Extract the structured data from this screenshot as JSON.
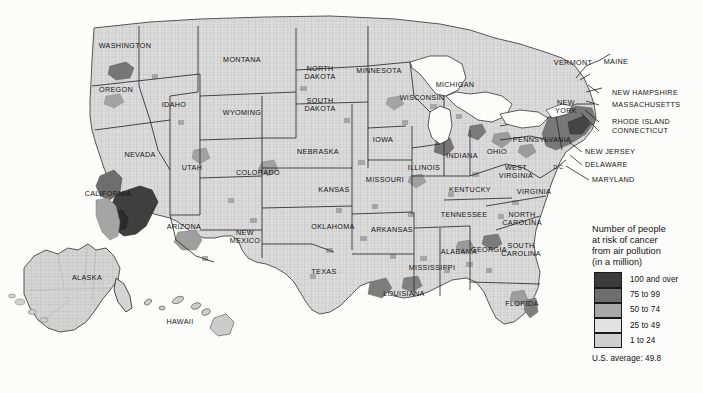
{
  "map": {
    "title": "Number of people at risk of cancer from air pollution (in a million)",
    "projection": "usa-albers-with-insets"
  },
  "legend": {
    "title": "Number of people\nat risk of cancer\nfrom air pollution\n(in a million)",
    "classes": [
      {
        "label": "100 and over",
        "color": "#3b3b3b",
        "min": 100,
        "max": null
      },
      {
        "label": "75 to 99",
        "color": "#6e6e6e",
        "min": 75,
        "max": 99
      },
      {
        "label": "50 to 74",
        "color": "#a8a8a8",
        "min": 50,
        "max": 74
      },
      {
        "label": "25 to 49",
        "color": "#e2e2e2",
        "min": 25,
        "max": 49
      },
      {
        "label": "1 to 24",
        "color": "#cfcfcf",
        "min": 1,
        "max": 24
      }
    ],
    "average_text": "U.S. average: 49.8",
    "average_value": 49.8
  },
  "state_labels": [
    {
      "name": "washington",
      "text": "WASHINGTON",
      "x": 125,
      "y": 46
    },
    {
      "name": "oregon",
      "text": "OREGON",
      "x": 116,
      "y": 90
    },
    {
      "name": "idaho",
      "text": "IDAHO",
      "x": 174,
      "y": 105
    },
    {
      "name": "montana",
      "text": "MONTANA",
      "x": 242,
      "y": 60
    },
    {
      "name": "wyoming",
      "text": "WYOMING",
      "x": 242,
      "y": 113
    },
    {
      "name": "nevada",
      "text": "NEVADA",
      "x": 140,
      "y": 155
    },
    {
      "name": "utah",
      "text": "UTAH",
      "x": 192,
      "y": 168
    },
    {
      "name": "colorado",
      "text": "COLORADO",
      "x": 258,
      "y": 173
    },
    {
      "name": "california",
      "text": "CALIFORNIA",
      "x": 108,
      "y": 194
    },
    {
      "name": "arizona",
      "text": "ARIZONA",
      "x": 184,
      "y": 227
    },
    {
      "name": "new-mexico",
      "text": "NEW\nMEXICO",
      "x": 245,
      "y": 237
    },
    {
      "name": "north-dakota",
      "text": "NORTH\nDAKOTA",
      "x": 320,
      "y": 73
    },
    {
      "name": "south-dakota",
      "text": "SOUTH\nDAKOTA",
      "x": 320,
      "y": 105
    },
    {
      "name": "nebraska",
      "text": "NEBRASKA",
      "x": 318,
      "y": 152
    },
    {
      "name": "kansas",
      "text": "KANSAS",
      "x": 334,
      "y": 190
    },
    {
      "name": "oklahoma",
      "text": "OKLAHOMA",
      "x": 333,
      "y": 227
    },
    {
      "name": "texas",
      "text": "TEXAS",
      "x": 324,
      "y": 272
    },
    {
      "name": "minnesota",
      "text": "MINNESOTA",
      "x": 379,
      "y": 71
    },
    {
      "name": "iowa",
      "text": "IOWA",
      "x": 383,
      "y": 140
    },
    {
      "name": "missouri",
      "text": "MISSOURI",
      "x": 385,
      "y": 180
    },
    {
      "name": "arkansas",
      "text": "ARKANSAS",
      "x": 392,
      "y": 230
    },
    {
      "name": "louisiana",
      "text": "LOUISIANA",
      "x": 404,
      "y": 294
    },
    {
      "name": "wisconsin",
      "text": "WISCONSIN",
      "x": 422,
      "y": 98
    },
    {
      "name": "illinois",
      "text": "ILLINOIS",
      "x": 424,
      "y": 168
    },
    {
      "name": "mississippi",
      "text": "MISSISSIPPI",
      "x": 432,
      "y": 268
    },
    {
      "name": "michigan",
      "text": "MICHIGAN",
      "x": 455,
      "y": 85
    },
    {
      "name": "indiana",
      "text": "INDIANA",
      "x": 462,
      "y": 156
    },
    {
      "name": "tennessee",
      "text": "TENNESSEE",
      "x": 464,
      "y": 215
    },
    {
      "name": "kentucky",
      "text": "KENTUCKY",
      "x": 470,
      "y": 190
    },
    {
      "name": "alabama",
      "text": "ALABAMA",
      "x": 459,
      "y": 252
    },
    {
      "name": "ohio",
      "text": "OHIO",
      "x": 497,
      "y": 152
    },
    {
      "name": "georgia",
      "text": "GEORGIA",
      "x": 489,
      "y": 250
    },
    {
      "name": "west-virginia",
      "text": "WEST\nVIRGINIA",
      "x": 516,
      "y": 172
    },
    {
      "name": "virginia",
      "text": "VIRGINIA",
      "x": 534,
      "y": 192
    },
    {
      "name": "north-carolina",
      "text": "NORTH\nCAROLINA",
      "x": 522,
      "y": 219
    },
    {
      "name": "south-carolina",
      "text": "SOUTH\nCAROLINA",
      "x": 521,
      "y": 250
    },
    {
      "name": "florida",
      "text": "FLORIDA",
      "x": 522,
      "y": 304
    },
    {
      "name": "pennsylvania",
      "text": "PENNSYLVANIA",
      "x": 542,
      "y": 140
    },
    {
      "name": "new-york",
      "text": "NEW\nYORK",
      "x": 566,
      "y": 107
    },
    {
      "name": "vermont",
      "text": "VERMONT",
      "x": 573,
      "y": 63
    },
    {
      "name": "maine",
      "text": "MAINE",
      "x": 616,
      "y": 62
    },
    {
      "name": "alaska",
      "text": "ALASKA",
      "x": 87,
      "y": 278
    },
    {
      "name": "hawaii",
      "text": "HAWAII",
      "x": 180,
      "y": 322
    },
    {
      "name": "dc",
      "text": "D.C.",
      "x": 559,
      "y": 167
    }
  ],
  "callout_labels": [
    {
      "name": "new-hampshire",
      "text": "NEW HAMPSHIRE",
      "x": 612,
      "y": 93,
      "lx": 599,
      "ly": 93,
      "tx": 588,
      "ty": 85
    },
    {
      "name": "massachusetts",
      "text": "MASSACHUSETTS",
      "x": 612,
      "y": 105,
      "lx": 599,
      "ly": 105,
      "tx": 586,
      "ty": 101
    },
    {
      "name": "rhode-island",
      "text": "RHODE ISLAND",
      "x": 612,
      "y": 122,
      "lx": 599,
      "ly": 122,
      "tx": 585,
      "ty": 110
    },
    {
      "name": "connecticut",
      "text": "CONNECTICUT",
      "x": 612,
      "y": 131,
      "lx": 599,
      "ly": 131,
      "tx": 581,
      "ty": 113
    },
    {
      "name": "new-jersey",
      "text": "NEW JERSEY",
      "x": 585,
      "y": 152,
      "lx": 582,
      "ly": 152,
      "tx": 569,
      "ty": 142
    },
    {
      "name": "delaware",
      "text": "DELAWARE",
      "x": 585,
      "y": 165,
      "lx": 582,
      "ly": 165,
      "tx": 570,
      "ty": 155
    },
    {
      "name": "maryland",
      "text": "MARYLAND",
      "x": 592,
      "y": 180,
      "lx": 589,
      "ly": 180,
      "tx": 566,
      "ty": 166
    }
  ]
}
